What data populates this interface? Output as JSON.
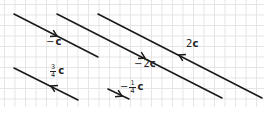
{
  "diagram": {
    "type": "vector-diagram",
    "grid": {
      "spacing_px": 10.5,
      "color": "#e4e4e4"
    },
    "line_color": "#1a1a1a",
    "vectors": [
      {
        "id": "neg-c",
        "label": "−c",
        "sign": "−",
        "coef": "",
        "letter": "c",
        "x1": 14,
        "y1": 14,
        "x2": 98,
        "y2": 57,
        "arrow": {
          "x": 57,
          "y": 36,
          "dir": "forward"
        },
        "label_pos": {
          "x": 46,
          "y": 40
        }
      },
      {
        "id": "neg-2c",
        "label": "−2c",
        "sign": "−",
        "coef": "2",
        "letter": "c",
        "x1": 57,
        "y1": 14,
        "x2": 222,
        "y2": 98,
        "arrow": {
          "x": 145,
          "y": 58,
          "dir": "forward"
        },
        "label_pos": {
          "x": 134,
          "y": 62
        }
      },
      {
        "id": "two-c",
        "label": "2c",
        "sign": "",
        "coef": "2",
        "letter": "c",
        "x1": 98,
        "y1": 14,
        "x2": 262,
        "y2": 98,
        "arrow": {
          "x": 179,
          "y": 55,
          "dir": "backward"
        },
        "label_pos": {
          "x": 186,
          "y": 42
        }
      },
      {
        "id": "three-quarter-c",
        "label": "3/4 c",
        "sign": "",
        "num": "3",
        "den": "4",
        "letter": "c",
        "x1": 14,
        "y1": 68,
        "x2": 78,
        "y2": 100,
        "arrow": {
          "x": 51,
          "y": 86,
          "dir": "backward"
        },
        "label_pos": {
          "x": 50,
          "y": 67
        }
      },
      {
        "id": "neg-quarter-c",
        "label": "−1/4 c",
        "sign": "−",
        "num": "1",
        "den": "4",
        "letter": "c",
        "x1": 108,
        "y1": 89,
        "x2": 129,
        "y2": 99,
        "arrow": {
          "x": 122,
          "y": 96,
          "dir": "forward"
        },
        "label_pos": {
          "x": 120,
          "y": 83
        }
      }
    ]
  }
}
